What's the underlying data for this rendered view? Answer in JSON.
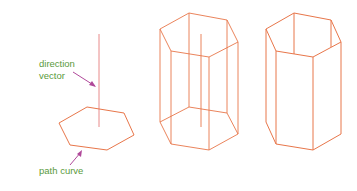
{
  "diagram": {
    "labels": {
      "direction_vector_line1": "direction",
      "direction_vector_line2": "vector",
      "path_curve": "path curve"
    },
    "colors": {
      "shape_stroke": "#e8764a",
      "vector_stroke": "#e88a8a",
      "arrow": "#b0499a",
      "label_text": "#5a9a3c"
    },
    "panels": [
      {
        "name": "path-and-vector",
        "description": "hexagon path curve with vertical direction vector"
      },
      {
        "name": "wireframe-prism",
        "description": "extruded hexagonal prism wireframe with vector"
      },
      {
        "name": "solid-prism",
        "description": "hexagonal prism with hidden lines removed"
      }
    ]
  }
}
